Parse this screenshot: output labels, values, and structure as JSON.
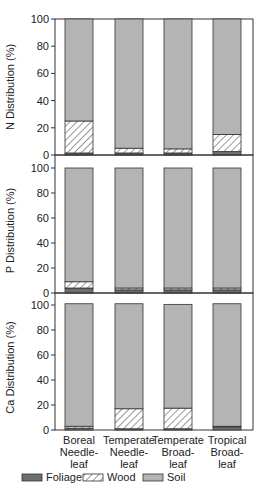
{
  "chart_data": {
    "type": "bar",
    "stacked": true,
    "categories": [
      [
        "Boreal",
        "Needle-",
        "leaf"
      ],
      [
        "Temperate",
        "Needle-",
        "leaf"
      ],
      [
        "Temperate",
        "Broad-",
        "leaf"
      ],
      [
        "Tropical",
        "Broad-",
        "leaf"
      ]
    ],
    "category_names": [
      "Boreal Needleleaf",
      "Temperate Needleleaf",
      "Temperate Broadleaf",
      "Tropical Broadleaf"
    ],
    "legend": [
      {
        "name": "Foliage",
        "fill": "#6e6e6e",
        "pattern": "solid"
      },
      {
        "name": "Wood",
        "fill": "#ffffff",
        "pattern": "hatch"
      },
      {
        "name": "Soil",
        "fill": "#b4b4b4",
        "pattern": "solid"
      }
    ],
    "legend_position": "bottom",
    "grid": false,
    "panels": [
      {
        "ylabel": "N Distribution (%)",
        "ylim": [
          0,
          100
        ],
        "yticks": [
          0,
          20,
          40,
          60,
          80,
          100
        ],
        "series": [
          {
            "name": "Foliage",
            "values": [
              1.5,
              1.5,
              1.5,
              2.5
            ]
          },
          {
            "name": "Wood",
            "values": [
              23.5,
              3.5,
              3,
              12.5
            ]
          },
          {
            "name": "Soil",
            "values": [
              75,
              95,
              95.5,
              85
            ]
          }
        ]
      },
      {
        "ylabel": "P Distribution (%)",
        "ylim": [
          0,
          100
        ],
        "yticks": [
          0,
          20,
          40,
          60,
          80,
          100
        ],
        "series": [
          {
            "name": "Foliage",
            "values": [
              4,
              2.5,
              2.5,
              2.5
            ]
          },
          {
            "name": "Wood",
            "values": [
              5,
              1.5,
              1.5,
              1.5
            ]
          },
          {
            "name": "Soil",
            "values": [
              91,
              96,
              96,
              96
            ]
          }
        ]
      },
      {
        "ylabel": "Ca Distribution (%)",
        "ylim": [
          0,
          100
        ],
        "yticks": [
          0,
          20,
          40,
          60,
          80,
          100
        ],
        "series": [
          {
            "name": "Foliage",
            "values": [
              1.5,
              1,
              1,
              2.5
            ]
          },
          {
            "name": "Wood",
            "values": [
              1.5,
              16,
              16.5,
              0.5
            ]
          },
          {
            "name": "Soil",
            "values": [
              98,
              84,
              83,
              98
            ]
          }
        ]
      }
    ],
    "title": "",
    "xlabel": ""
  }
}
